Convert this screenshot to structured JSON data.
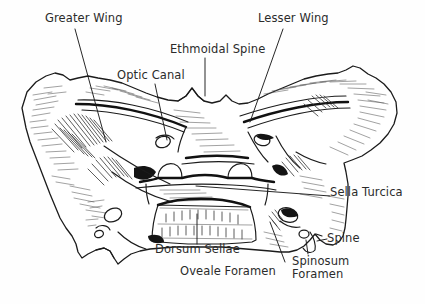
{
  "figure": {
    "style": "pen-and-ink-line-drawing",
    "ink_color": "#1b1b1b",
    "background_color": "#fefefe",
    "label_color": "#2b2b2b"
  },
  "labels": {
    "greater_wing": "Greater Wing",
    "lesser_wing": "Lesser Wing",
    "ethmoidal_spine": "Ethmoidal Spine",
    "optic_canal": "Optic Canal",
    "sella_turcica": "Sella Turcica",
    "dorsum_sellae": "Dorsum Sellae",
    "oveale_foramen": "Oveale Foramen",
    "spine": "Spine",
    "spinosum_foramen_line1": "Spinosum",
    "spinosum_foramen_line2": "Foramen"
  }
}
